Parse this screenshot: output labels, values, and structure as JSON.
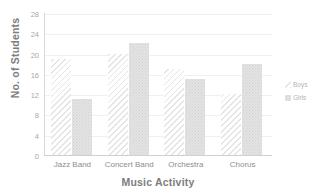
{
  "chart_data": {
    "type": "bar",
    "title": "",
    "xlabel": "Music Activity",
    "ylabel": "No. of Students",
    "categories": [
      "Jazz Band",
      "Concert Band",
      "Orchestra",
      "Chorus"
    ],
    "series": [
      {
        "name": "Boys",
        "values": [
          19,
          20,
          17,
          12
        ],
        "pattern": "diagonal-hatch",
        "color": "#e4e4e4"
      },
      {
        "name": "Girls",
        "values": [
          11,
          22,
          15,
          18
        ],
        "pattern": "dotted-fill",
        "color": "#e3e3e3"
      }
    ],
    "ylim": [
      0,
      28
    ],
    "yticks": [
      0,
      4,
      8,
      12,
      16,
      20,
      24,
      28
    ],
    "grid": true,
    "legend_position": "right"
  },
  "legend": {
    "entries": [
      {
        "label": "Boys"
      },
      {
        "label": "Girls"
      }
    ]
  }
}
